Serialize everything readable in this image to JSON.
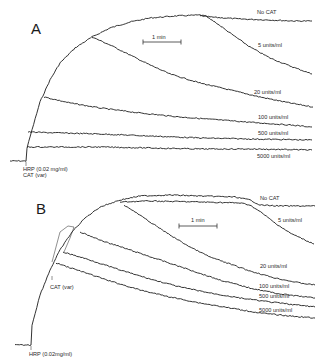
{
  "chart_data": [
    {
      "type": "line",
      "panel": "A",
      "title": "A",
      "scale_bar": "1 min",
      "annotations": [
        "HRP (0.02 mg/ml)",
        "CAT (var)"
      ],
      "xlabel": "",
      "ylabel": "",
      "grid": false,
      "series": [
        {
          "name": "No CAT",
          "label_pos": [
            268,
            13
          ],
          "points": [
            [
              10,
              161
            ],
            [
              26,
              161
            ],
            [
              27,
              148
            ],
            [
              32,
              130
            ],
            [
              40,
              102
            ],
            [
              50,
              80
            ],
            [
              60,
              63
            ],
            [
              75,
              48
            ],
            [
              92,
              37
            ],
            [
              110,
              28
            ],
            [
              130,
              22
            ],
            [
              150,
              18
            ],
            [
              175,
              16
            ],
            [
              200,
              15
            ],
            [
              210,
              17
            ],
            [
              240,
              19
            ],
            [
              270,
              20
            ],
            [
              295,
              21
            ],
            [
              312,
              21
            ]
          ]
        },
        {
          "name": "5 units/ml",
          "label_pos": [
            268,
            45
          ],
          "points": [
            [
              200,
              16
            ],
            [
              205,
              16
            ],
            [
              215,
              22
            ],
            [
              230,
              33
            ],
            [
              250,
              47
            ],
            [
              270,
              58
            ],
            [
              290,
              66
            ],
            [
              312,
              74
            ]
          ]
        },
        {
          "name": "20 units/ml",
          "label_pos": [
            254,
            92
          ],
          "points": [
            [
              92,
              37
            ],
            [
              110,
              45
            ],
            [
              130,
              55
            ],
            [
              150,
              65
            ],
            [
              170,
              74
            ],
            [
              200,
              83
            ],
            [
              230,
              90
            ],
            [
              260,
              97
            ],
            [
              290,
              103
            ],
            [
              313,
              107
            ]
          ]
        },
        {
          "name": "100 units/ml",
          "label_pos": [
            258,
            117
          ],
          "points": [
            [
              44,
              97
            ],
            [
              70,
              103
            ],
            [
              100,
              108
            ],
            [
              140,
              113
            ],
            [
              180,
              117
            ],
            [
              220,
              120
            ],
            [
              260,
              123
            ],
            [
              290,
              125
            ],
            [
              312,
              127
            ]
          ]
        },
        {
          "name": "500 units/ml",
          "label_pos": [
            258,
            134
          ],
          "points": [
            [
              28,
              132
            ],
            [
              60,
              133
            ],
            [
              100,
              134
            ],
            [
              150,
              136
            ],
            [
              200,
              138
            ],
            [
              250,
              139
            ],
            [
              312,
              140
            ]
          ]
        },
        {
          "name": "5000 units/ml",
          "label_pos": [
            256,
            157
          ],
          "points": [
            [
              27,
              147
            ],
            [
              60,
              147
            ],
            [
              100,
              147
            ],
            [
              150,
              148
            ],
            [
              200,
              149
            ],
            [
              250,
              149
            ],
            [
              312,
              150
            ]
          ]
        }
      ]
    },
    {
      "type": "line",
      "panel": "B",
      "title": "B",
      "scale_bar": "1 min",
      "annotations": [
        "CAT (var)",
        "HRP (0.02mg/ml)"
      ],
      "xlabel": "",
      "ylabel": "",
      "grid": false,
      "series": [
        {
          "name": "No CAT",
          "label_pos": [
            260,
            198
          ],
          "points": [
            [
              15,
              345
            ],
            [
              31,
              345
            ],
            [
              32,
              325
            ],
            [
              40,
              295
            ],
            [
              50,
              270
            ],
            [
              60,
              250
            ],
            [
              72,
              232
            ],
            [
              85,
              218
            ],
            [
              100,
              207
            ],
            [
              120,
              200
            ],
            [
              140,
              196
            ],
            [
              170,
              195
            ],
            [
              200,
              196
            ],
            [
              235,
              197
            ],
            [
              250,
              200
            ],
            [
              260,
              205
            ],
            [
              280,
              206
            ],
            [
              300,
              206
            ],
            [
              315,
              206
            ]
          ]
        },
        {
          "name": "5 units/ml",
          "label_pos": [
            278,
            220
          ],
          "points": [
            [
              120,
              202
            ],
            [
              150,
              201
            ],
            [
              200,
              202
            ],
            [
              240,
              203
            ],
            [
              250,
              205
            ],
            [
              262,
              213
            ],
            [
              275,
              223
            ],
            [
              290,
              233
            ],
            [
              305,
              240
            ],
            [
              314,
              244
            ]
          ]
        },
        {
          "name": "20 units/ml",
          "label_pos": [
            260,
            267
          ],
          "points": [
            [
              124,
              205
            ],
            [
              135,
              212
            ],
            [
              150,
              222
            ],
            [
              170,
              235
            ],
            [
              190,
              247
            ],
            [
              210,
              257
            ],
            [
              230,
              264
            ],
            [
              250,
              271
            ],
            [
              275,
              278
            ],
            [
              300,
              283
            ],
            [
              315,
              285
            ]
          ]
        },
        {
          "name": "100 units/ml",
          "label_pos": [
            258,
            288
          ],
          "points": [
            [
              80,
              232
            ],
            [
              100,
              240
            ],
            [
              130,
              250
            ],
            [
              160,
              260
            ],
            [
              190,
              270
            ],
            [
              220,
              280
            ],
            [
              250,
              288
            ],
            [
              280,
              294
            ],
            [
              315,
              298
            ]
          ]
        },
        {
          "name": "500 units/ml",
          "label_pos": [
            258,
            297
          ],
          "points": [
            [
              63,
              252
            ],
            [
              90,
              260
            ],
            [
              120,
              270
            ],
            [
              150,
              279
            ],
            [
              180,
              287
            ],
            [
              210,
              293
            ],
            [
              240,
              298
            ],
            [
              270,
              302
            ],
            [
              315,
              307
            ]
          ]
        },
        {
          "name": "5000 units/ml",
          "label_pos": [
            258,
            311
          ],
          "points": [
            [
              56,
              263
            ],
            [
              80,
              271
            ],
            [
              110,
              281
            ],
            [
              140,
              290
            ],
            [
              170,
              297
            ],
            [
              200,
              303
            ],
            [
              230,
              308
            ],
            [
              260,
              313
            ],
            [
              290,
              316
            ],
            [
              315,
              318
            ]
          ]
        }
      ]
    }
  ],
  "panelA": {
    "letter": "A",
    "scale_label": "1 min",
    "labels": {
      "no_cat": "No CAT",
      "u5": "5 units/ml",
      "u20": "20 units/ml",
      "u100": "100 units/ml",
      "u500": "500 units/ml",
      "u5000": "5000 units/ml"
    },
    "annotation_hrp": "HRP (0.02 mg/ml)",
    "annotation_cat": "CAT (var)"
  },
  "panelB": {
    "letter": "B",
    "scale_label": "1 min",
    "labels": {
      "no_cat": "No CAT",
      "u5": "5 units/ml",
      "u20": "20 units/ml",
      "u100": "100 units/ml",
      "u500": "500 units/ml",
      "u5000": "5000 units/ml"
    },
    "annotation_cat": "CAT (var)",
    "annotation_hrp": "HRP (0.02mg/ml)"
  }
}
